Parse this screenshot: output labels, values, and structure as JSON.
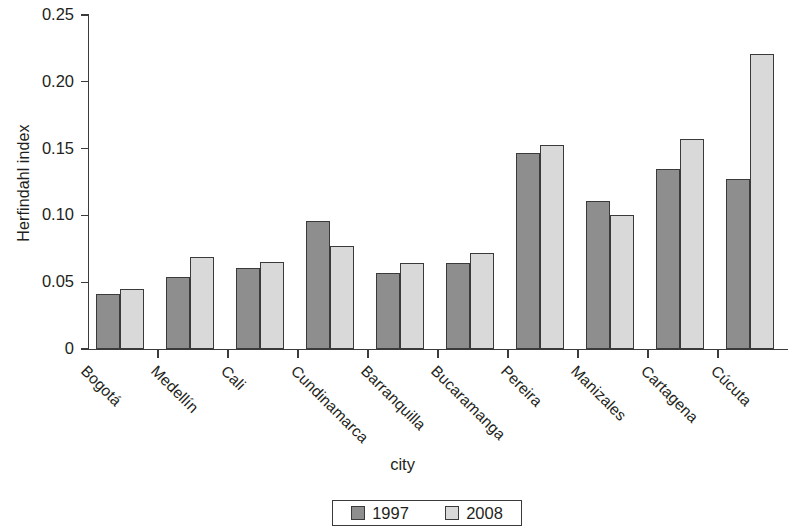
{
  "chart_data": {
    "type": "bar",
    "title": "",
    "xlabel": "city",
    "ylabel": "Herfindahl index",
    "categories": [
      "Bogotá",
      "Medellín",
      "Cali",
      "Cundinamarca",
      "Barranquilla",
      "Bucaramanga",
      "Pereira",
      "Manizales",
      "Cartagena",
      "Cúcuta"
    ],
    "series": [
      {
        "name": "1997",
        "color": "#8e8e8e",
        "values": [
          0.041,
          0.054,
          0.061,
          0.096,
          0.057,
          0.064,
          0.147,
          0.111,
          0.135,
          0.127
        ]
      },
      {
        "name": "2008",
        "color": "#d9d9d9",
        "values": [
          0.045,
          0.069,
          0.065,
          0.077,
          0.064,
          0.072,
          0.153,
          0.1,
          0.157,
          0.221
        ]
      }
    ],
    "ylim": [
      0,
      0.25
    ],
    "ytick_values": [
      0,
      0.05,
      0.1,
      0.15,
      0.2,
      0.25
    ],
    "ytick_labels": [
      "0",
      "0.05",
      "0.10",
      "0.15",
      "0.20",
      "0.25"
    ],
    "grid": false,
    "legend_position": "bottom-center",
    "legend_entries": [
      "1997",
      "2008"
    ]
  }
}
